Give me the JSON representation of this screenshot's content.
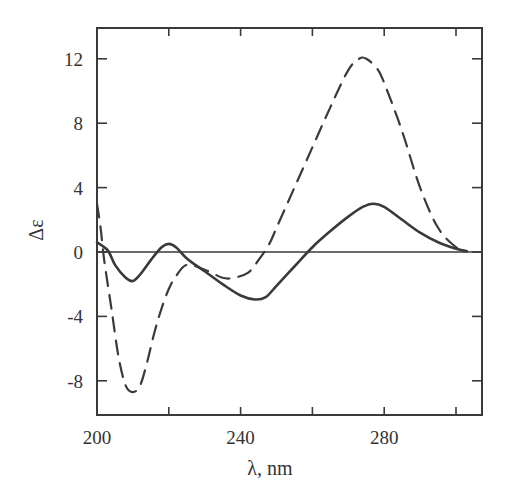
{
  "chart_data": {
    "type": "line",
    "title": "",
    "xlabel": "λ, nm",
    "ylabel": "Δε",
    "xlim": [
      200,
      308
    ],
    "ylim": [
      -10,
      14
    ],
    "xticks": [
      200,
      220,
      240,
      260,
      280,
      300
    ],
    "xtick_labels": [
      "200",
      "",
      "240",
      "",
      "280",
      ""
    ],
    "yticks": [
      12,
      8,
      4,
      0,
      -4,
      -8
    ],
    "ytick_labels": [
      "12",
      "8",
      "4",
      "0",
      "-4",
      "-8"
    ],
    "grid": false,
    "legend": null,
    "reference_line": {
      "y": 0
    },
    "series": [
      {
        "name": "solid",
        "style": "solid",
        "x": [
          200,
          203,
          205,
          208,
          210,
          212,
          215,
          218,
          220,
          222,
          225,
          230,
          235,
          240,
          244,
          247,
          250,
          255,
          260,
          265,
          270,
          274,
          277,
          280,
          285,
          290,
          295,
          300,
          303
        ],
        "y": [
          0.6,
          0.1,
          -0.8,
          -1.6,
          -1.8,
          -1.4,
          -0.5,
          0.3,
          0.5,
          0.3,
          -0.4,
          -1.2,
          -2.0,
          -2.7,
          -2.95,
          -2.8,
          -2.1,
          -0.9,
          0.3,
          1.3,
          2.2,
          2.8,
          3.0,
          2.8,
          2.0,
          1.2,
          0.6,
          0.2,
          0.05
        ]
      },
      {
        "name": "dashed",
        "style": "dashed",
        "x": [
          200,
          201,
          202,
          204,
          206,
          208,
          210,
          212,
          214,
          216,
          218,
          220,
          222,
          225,
          230,
          235,
          238,
          242,
          245,
          248,
          250,
          255,
          260,
          265,
          270,
          273,
          275,
          278,
          280,
          285,
          290,
          295,
          300,
          303
        ],
        "y": [
          3.0,
          1.5,
          -0.5,
          -3.5,
          -6.5,
          -8.3,
          -8.7,
          -8.3,
          -6.8,
          -5.0,
          -3.5,
          -2.3,
          -1.5,
          -0.8,
          -1.1,
          -1.6,
          -1.6,
          -1.3,
          -0.5,
          0.5,
          1.5,
          4.0,
          6.5,
          9.0,
          11.3,
          12.0,
          12.0,
          11.4,
          10.5,
          7.5,
          4.0,
          1.5,
          0.3,
          0.05
        ]
      }
    ]
  },
  "colors": {
    "line": "#3a3a3a",
    "axis": "#3a3a3a",
    "background": "#ffffff"
  }
}
